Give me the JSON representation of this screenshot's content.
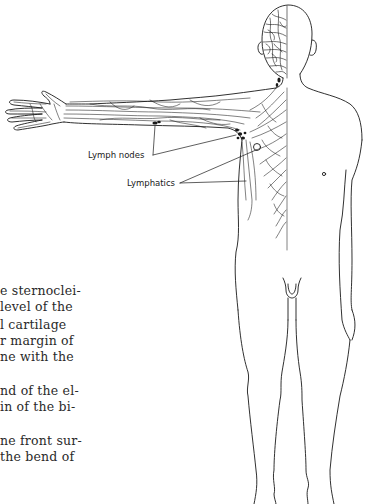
{
  "figure": {
    "labels": {
      "lymph_nodes": "Lymph nodes",
      "lymphatics": "Lymphatics"
    },
    "line_color": "#1a1a1a"
  },
  "body_text": {
    "lines": [
      "e sternoclei-",
      "level of the",
      "l cartilage",
      "r margin of",
      "ne with the",
      "nd of the el-",
      "in of the bi-",
      "ne front sur-",
      " the bend of"
    ]
  }
}
